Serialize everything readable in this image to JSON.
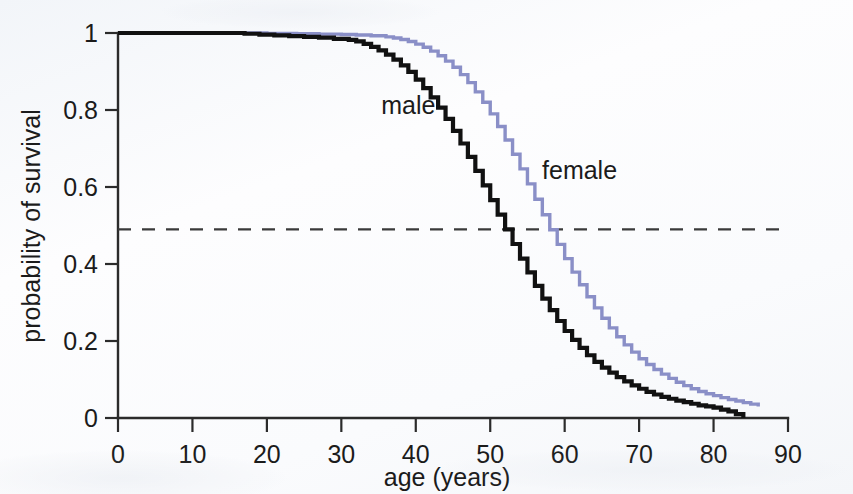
{
  "chart_data": {
    "type": "line",
    "title": "",
    "subtitle": "",
    "xlabel": "age (years)",
    "ylabel": "probability of survival",
    "xlim": [
      0,
      90
    ],
    "ylim": [
      0,
      1
    ],
    "xticks": [
      "0",
      "10",
      "20",
      "30",
      "40",
      "50",
      "60",
      "70",
      "80",
      "90"
    ],
    "xtick_values": [
      0,
      10,
      20,
      30,
      40,
      50,
      60,
      70,
      80,
      90
    ],
    "yticks": [
      "0",
      "0.2",
      "0.4",
      "0.6",
      "0.8",
      "1"
    ],
    "ytick_values": [
      0,
      0.2,
      0.4,
      0.6,
      0.8,
      1
    ],
    "grid": false,
    "legend_position": "inline-annotation",
    "step_style": "post",
    "annotations": [
      {
        "text": "male",
        "x": 39,
        "y": 0.79,
        "color": "#1b1b1b"
      },
      {
        "text": "female",
        "x": 62,
        "y": 0.62,
        "color": "#1b1b1b"
      }
    ],
    "reference_lines": [
      {
        "orientation": "horizontal",
        "value": 0.49,
        "style": "dashed",
        "color": "#3a3a3a",
        "label": ""
      }
    ],
    "median_survival": {
      "male": 52,
      "female": 57
    },
    "series": [
      {
        "name": "male",
        "color": "#111111",
        "x": [
          0,
          2,
          5,
          8,
          11,
          14,
          17,
          19,
          21,
          23,
          25,
          27,
          29,
          31,
          32,
          33,
          34,
          35,
          36,
          37,
          38,
          39,
          40,
          41,
          42,
          43,
          44,
          45,
          46,
          47,
          48,
          49,
          50,
          51,
          52,
          53,
          54,
          55,
          56,
          57,
          58,
          59,
          60,
          61,
          62,
          63,
          64,
          65,
          66,
          67,
          68,
          69,
          70,
          71,
          72,
          73,
          74,
          75,
          76,
          77,
          78,
          79,
          80,
          81,
          82,
          83,
          84
        ],
        "values": [
          1,
          1,
          1,
          1,
          1,
          1,
          0.998,
          0.996,
          0.994,
          0.992,
          0.99,
          0.988,
          0.985,
          0.982,
          0.978,
          0.972,
          0.964,
          0.955,
          0.944,
          0.931,
          0.916,
          0.899,
          0.879,
          0.857,
          0.833,
          0.806,
          0.777,
          0.746,
          0.713,
          0.678,
          0.642,
          0.604,
          0.566,
          0.528,
          0.49,
          0.452,
          0.414,
          0.378,
          0.343,
          0.31,
          0.28,
          0.252,
          0.226,
          0.203,
          0.182,
          0.163,
          0.146,
          0.131,
          0.118,
          0.106,
          0.095,
          0.085,
          0.076,
          0.068,
          0.061,
          0.055,
          0.05,
          0.045,
          0.041,
          0.037,
          0.033,
          0.03,
          0.027,
          0.022,
          0.017,
          0.01,
          0.0
        ]
      },
      {
        "name": "female",
        "color": "#8a8fc7",
        "x": [
          0,
          3,
          7,
          12,
          16,
          20,
          24,
          27,
          30,
          32,
          34,
          36,
          37,
          38,
          39,
          40,
          41,
          42,
          43,
          44,
          45,
          46,
          47,
          48,
          49,
          50,
          51,
          52,
          53,
          54,
          55,
          56,
          57,
          58,
          59,
          60,
          61,
          62,
          63,
          64,
          65,
          66,
          67,
          68,
          69,
          70,
          71,
          72,
          73,
          74,
          75,
          76,
          77,
          78,
          79,
          80,
          81,
          82,
          83,
          84,
          85,
          86
        ],
        "values": [
          1,
          1,
          1,
          1,
          1,
          0.999,
          0.998,
          0.997,
          0.996,
          0.995,
          0.993,
          0.99,
          0.987,
          0.983,
          0.978,
          0.971,
          0.963,
          0.953,
          0.941,
          0.927,
          0.911,
          0.892,
          0.871,
          0.847,
          0.82,
          0.79,
          0.757,
          0.722,
          0.685,
          0.647,
          0.608,
          0.568,
          0.528,
          0.489,
          0.451,
          0.414,
          0.379,
          0.346,
          0.315,
          0.286,
          0.259,
          0.234,
          0.211,
          0.19,
          0.171,
          0.154,
          0.139,
          0.126,
          0.114,
          0.103,
          0.093,
          0.084,
          0.076,
          0.069,
          0.063,
          0.058,
          0.053,
          0.048,
          0.044,
          0.04,
          0.036,
          0.03
        ]
      }
    ]
  },
  "axis": {
    "x_title": "age (years)",
    "y_title": "probability of survival"
  }
}
